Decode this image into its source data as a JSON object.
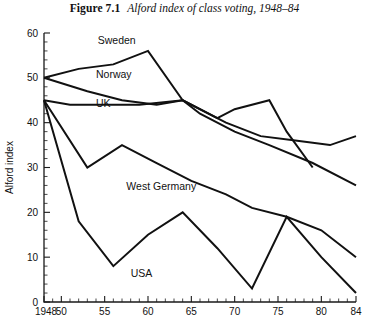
{
  "figure": {
    "number_label": "Figure 7.1",
    "caption": "Alford index of class voting, 1948–84"
  },
  "chart_data": {
    "type": "line",
    "title": "Alford index of class voting, 1948–84",
    "xlabel": "",
    "ylabel": "Alford index",
    "xlim": [
      1948,
      1984
    ],
    "ylim": [
      0,
      60
    ],
    "grid": false,
    "legend": "inline-labels",
    "y_ticks": [
      0,
      10,
      20,
      30,
      40,
      50,
      60
    ],
    "y_tick_labels": [
      "0",
      "10",
      "20",
      "30",
      "40",
      "50",
      "60"
    ],
    "y_minor_tick_step": 2,
    "x_ticks": [
      1948,
      1950,
      1955,
      1960,
      1965,
      1970,
      1975,
      1980,
      1984
    ],
    "x_tick_labels": [
      "1948",
      "50",
      "55",
      "60",
      "65",
      "70",
      "75",
      "80",
      "84"
    ],
    "x_minor_tick_step": 1,
    "series": [
      {
        "name": "Sweden",
        "label": "Sweden",
        "label_x": 1954.2,
        "label_y": 57.5,
        "x": [
          1948,
          1952,
          1956,
          1960,
          1964,
          1968,
          1970,
          1974,
          1976,
          1979
        ],
        "y": [
          50,
          52,
          53,
          56,
          45,
          41,
          43,
          45,
          38,
          30
        ]
      },
      {
        "name": "Norway",
        "label": "Norway",
        "label_x": 1954.0,
        "label_y": 50.0,
        "x": [
          1948,
          1953,
          1957,
          1961,
          1964,
          1969,
          1973,
          1977,
          1981,
          1984
        ],
        "y": [
          50,
          47,
          45,
          44,
          45,
          40,
          37,
          36,
          35,
          37
        ]
      },
      {
        "name": "UK",
        "label": "UK",
        "label_x": 1954.0,
        "label_y": 43.5,
        "x": [
          1948,
          1951,
          1955,
          1959,
          1964,
          1966,
          1970,
          1974,
          1979,
          1984
        ],
        "y": [
          45,
          44,
          44,
          44,
          45,
          42,
          38,
          35,
          31,
          26
        ]
      },
      {
        "name": "West Germany",
        "label": "West Germany",
        "label_x": 1957.5,
        "label_y": 25.0,
        "x": [
          1948,
          1953,
          1957,
          1961,
          1965,
          1969,
          1972,
          1976,
          1980,
          1984
        ],
        "y": [
          45,
          30,
          35,
          31,
          27,
          24,
          21,
          19,
          16,
          10
        ]
      },
      {
        "name": "USA",
        "label": "USA",
        "label_x": 1958.0,
        "label_y": 5.5,
        "x": [
          1948,
          1952,
          1956,
          1960,
          1964,
          1968,
          1972,
          1976,
          1980,
          1984
        ],
        "y": [
          45,
          18,
          8,
          15,
          20,
          12,
          3,
          19,
          10,
          2
        ]
      }
    ]
  },
  "colors": {
    "line": "#111111",
    "axis": "#1a1a1a",
    "background": "#ffffff"
  }
}
